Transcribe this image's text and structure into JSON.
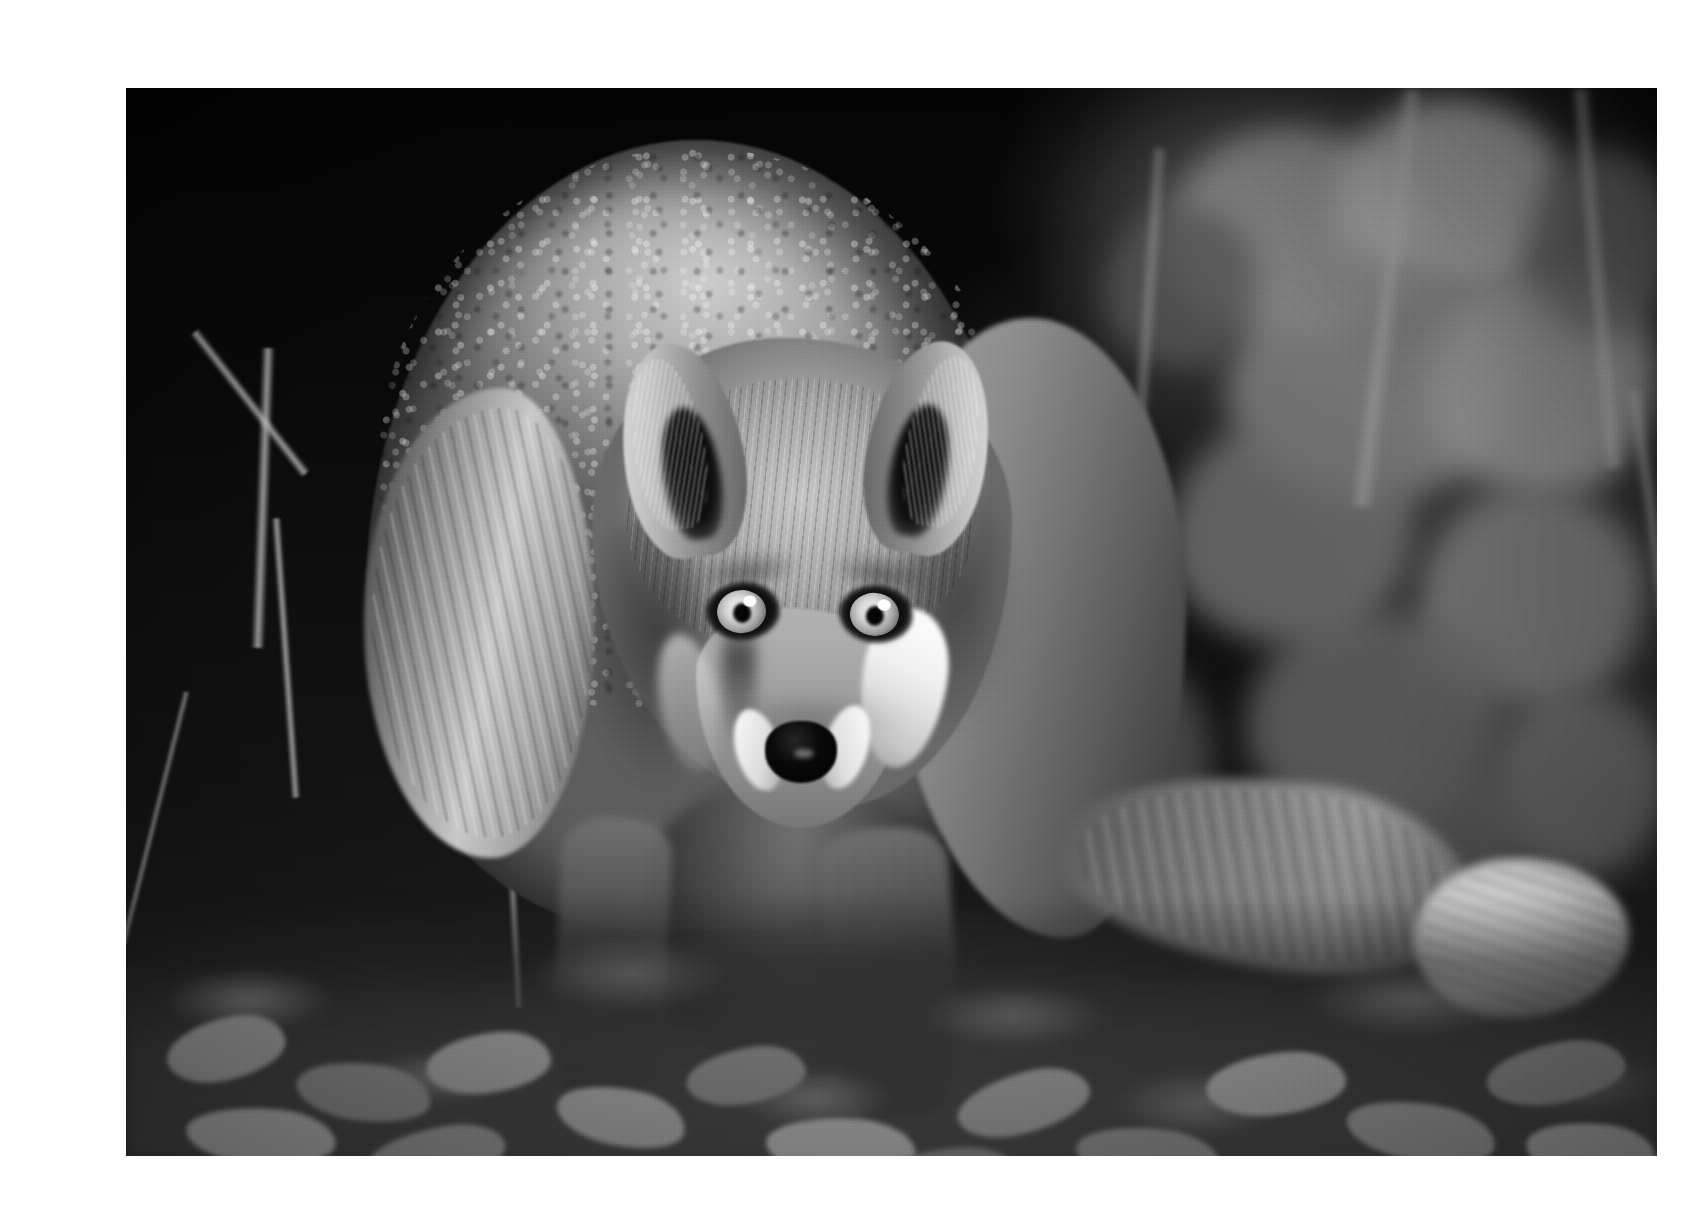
{
  "page": {
    "background_color": "#ffffff",
    "width": 1703,
    "height": 1208
  },
  "photo": {
    "subject": "red fox",
    "title": "Red fox facing camera in woodland leaf litter",
    "medium": "black-and-white photograph",
    "color_mode": "grayscale",
    "alt_text": "A monochrome photograph of a red fox crouched low, facing the camera directly with both eyes catching the light, standing on fallen leaves with blurred foliage behind.",
    "frame": {
      "left": 86,
      "top": 72,
      "width": 1531,
      "height": 1068
    },
    "palette": {
      "paper": "#ffffff",
      "deep_shadow": "#070707",
      "background_dark": "#101010",
      "midtone_fur": "#9a9a9a",
      "highlight_fur": "#e8e8e8",
      "white_markings": "#fafafa",
      "nose_black": "#060606",
      "ground_litter": "#5e5e5e"
    },
    "regions": [
      {
        "name": "background-foliage",
        "description": "blurred out-of-focus leaves and stems, brightest at upper right"
      },
      {
        "name": "fox-body",
        "description": "arched back and shoulders filling the left-centre of the frame"
      },
      {
        "name": "fox-head",
        "description": "head lowered, pointed toward viewer, centred"
      },
      {
        "name": "fox-ears",
        "description": "two upright pointed ears with dark inner hollows and pale rim fur"
      },
      {
        "name": "fox-eyes",
        "description": "two bright pale irises with dark pupils and specular catchlights"
      },
      {
        "name": "fox-nose",
        "description": "black glossy nose flanked by white muzzle fur"
      },
      {
        "name": "fox-legs",
        "description": "front legs in deep shadow below the chest"
      },
      {
        "name": "fox-tail",
        "description": "bushy tail sweeping to the right with a white tip"
      },
      {
        "name": "ground-leaf-litter",
        "description": "fallen leaves covering the bottom quarter of the frame"
      }
    ]
  }
}
